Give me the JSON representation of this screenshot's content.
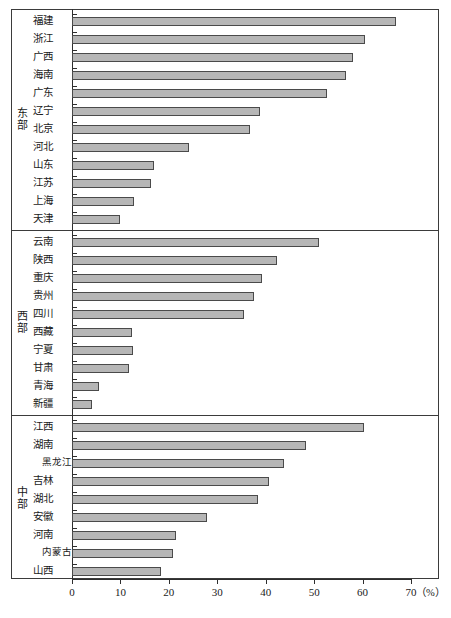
{
  "chart_data": {
    "type": "bar",
    "orientation": "horizontal",
    "title": "",
    "xlabel": "(%)",
    "ylabel": "",
    "xlim": [
      0,
      70
    ],
    "xticks": [
      0,
      10,
      20,
      30,
      40,
      50,
      60,
      70
    ],
    "xtick_labels": [
      "0",
      "10",
      "20",
      "30",
      "40",
      "50",
      "60",
      "70"
    ],
    "unit_label": "（%）",
    "grid": false,
    "legend": null,
    "bar_color": "#b6b6b6",
    "bar_edge_color": "#4a4a4a",
    "axis_color": "#2e2e2e",
    "groups": [
      {
        "label": "东部",
        "categories": [
          "福建",
          "浙江",
          "广西",
          "海南",
          "广东",
          "辽宁",
          "北京",
          "河北",
          "山东",
          "江苏",
          "上海",
          "天津"
        ],
        "values": [
          66.8,
          60.5,
          58.0,
          56.5,
          52.7,
          38.8,
          36.7,
          24.2,
          17.0,
          16.3,
          12.7,
          10.0
        ]
      },
      {
        "label": "西部",
        "categories": [
          "云南",
          "陕西",
          "重庆",
          "贵州",
          "四川",
          "西藏",
          "宁夏",
          "甘肃",
          "青海",
          "新疆"
        ],
        "values": [
          51.0,
          42.3,
          39.2,
          37.5,
          35.6,
          12.3,
          12.5,
          11.7,
          5.6,
          4.2
        ]
      },
      {
        "label": "中部",
        "categories": [
          "江西",
          "湖南",
          "黑龙江",
          "吉林",
          "湖北",
          "安徽",
          "河南",
          "内蒙古",
          "山西"
        ],
        "values": [
          60.3,
          48.3,
          43.7,
          40.7,
          38.4,
          27.8,
          21.5,
          20.8,
          18.3
        ]
      }
    ]
  }
}
